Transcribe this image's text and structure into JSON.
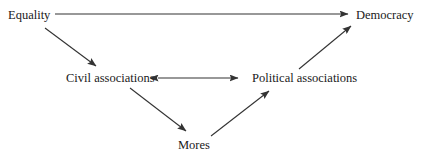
{
  "diagram": {
    "type": "flow-diagram",
    "title": "",
    "background_color": "#ffffff",
    "line_color": "#333333",
    "text_color": "#1a1a1a",
    "nodes": [
      {
        "id": "equality",
        "label": "Equality"
      },
      {
        "id": "democracy",
        "label": "Democracy"
      },
      {
        "id": "civil",
        "label": "Civil associations"
      },
      {
        "id": "political",
        "label": "Political associations"
      },
      {
        "id": "mores",
        "label": "Mores"
      }
    ],
    "edges": [
      {
        "from": "equality",
        "to": "democracy",
        "style": "single-arrow",
        "direction": "right"
      },
      {
        "from": "equality",
        "to": "civil",
        "style": "single-arrow",
        "direction": "down-right"
      },
      {
        "from": "civil",
        "to": "political",
        "style": "double-arrow",
        "direction": "both"
      },
      {
        "from": "civil",
        "to": "mores",
        "style": "single-arrow",
        "direction": "down-right"
      },
      {
        "from": "mores",
        "to": "political",
        "style": "single-arrow",
        "direction": "up-right"
      },
      {
        "from": "political",
        "to": "democracy",
        "style": "single-arrow",
        "direction": "up-right"
      }
    ]
  }
}
